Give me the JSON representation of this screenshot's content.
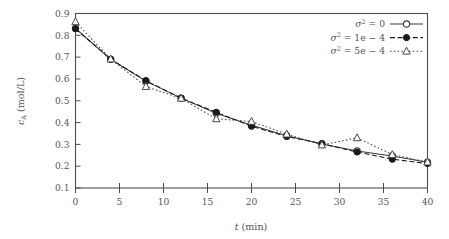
{
  "chart_data": {
    "type": "line",
    "title": "",
    "xlabel": "t (min)",
    "ylabel": "c_A (mol/L)",
    "xlim": [
      0,
      40
    ],
    "ylim": [
      0.1,
      0.9
    ],
    "xticks": [
      0,
      5,
      10,
      15,
      20,
      25,
      30,
      35,
      40
    ],
    "yticks": [
      0.1,
      0.2,
      0.3,
      0.4,
      0.5,
      0.6,
      0.7,
      0.8,
      0.9
    ],
    "xtick_labels": [
      "0",
      "5",
      "10",
      "15",
      "20",
      "25",
      "30",
      "35",
      "40"
    ],
    "ytick_labels": [
      "0.1",
      "0.2",
      "0.3",
      "0.4",
      "0.5",
      "0.6",
      "0.7",
      "0.8",
      "0.9"
    ],
    "grid": false,
    "legend_position": "top-right",
    "x": [
      0,
      4,
      8,
      12,
      16,
      20,
      24,
      28,
      32,
      36,
      40
    ],
    "series": [
      {
        "name": "sigma2 = 0",
        "label": "σ² = 0",
        "label_base": "σ",
        "label_exp": "2",
        "label_rest": " = 0",
        "marker": "open-circle",
        "linestyle": "solid",
        "color": "#3a3a3a",
        "values": [
          0.832,
          0.69,
          0.59,
          0.512,
          0.443,
          0.388,
          0.34,
          0.302,
          0.27,
          0.247,
          0.218
        ]
      },
      {
        "name": "sigma2 = 1e-4",
        "label": "σ² = 1e − 4",
        "label_base": "σ",
        "label_exp": "2",
        "label_rest": " = 1e − 4",
        "marker": "filled-circle",
        "linestyle": "dashed",
        "color": "#1a1a1a",
        "values": [
          0.83,
          0.69,
          0.592,
          0.512,
          0.447,
          0.383,
          0.336,
          0.303,
          0.265,
          0.232,
          0.212
        ]
      },
      {
        "name": "sigma2 = 5e-4",
        "label": "σ² = 5e − 4",
        "label_base": "σ",
        "label_exp": "2",
        "label_rest": " = 5e − 4",
        "marker": "open-triangle",
        "linestyle": "dotted",
        "color": "#4a4a4a",
        "values": [
          0.862,
          0.691,
          0.565,
          0.511,
          0.417,
          0.405,
          0.347,
          0.297,
          0.33,
          0.253,
          0.219
        ]
      }
    ]
  }
}
